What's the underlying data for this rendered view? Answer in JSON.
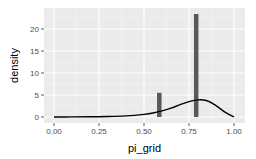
{
  "chart_data": {
    "type": "bar",
    "title": "",
    "xlabel": "pi_grid",
    "ylabel": "density",
    "xlim": [
      -0.05,
      1.05
    ],
    "ylim": [
      -1.3,
      25.5
    ],
    "grid": true,
    "legend": null,
    "x_ticks": [
      "0.00",
      "0.25",
      "0.50",
      "0.75",
      "1.00"
    ],
    "x_tick_values": [
      0.0,
      0.25,
      0.5,
      0.75,
      1.0
    ],
    "y_ticks": [
      "0",
      "5",
      "10",
      "15",
      "20"
    ],
    "y_tick_values": [
      0,
      5,
      10,
      15,
      20
    ],
    "series": [
      {
        "name": "histogram",
        "type": "bar",
        "bars": [
          {
            "x": 0.585,
            "width": 0.025,
            "height": 5.5
          },
          {
            "x": 0.79,
            "width": 0.025,
            "height": 23.4
          }
        ],
        "color": "#595959"
      },
      {
        "name": "density",
        "type": "line",
        "x": [
          0.0,
          0.1,
          0.2,
          0.3,
          0.4,
          0.5,
          0.55,
          0.6,
          0.65,
          0.7,
          0.75,
          0.8,
          0.85,
          0.9,
          0.95,
          1.0
        ],
        "y": [
          0.0,
          0.02,
          0.05,
          0.1,
          0.25,
          0.6,
          0.9,
          1.4,
          2.0,
          2.8,
          3.5,
          3.9,
          3.7,
          2.6,
          1.1,
          0.0
        ],
        "color": "#000000"
      }
    ]
  }
}
